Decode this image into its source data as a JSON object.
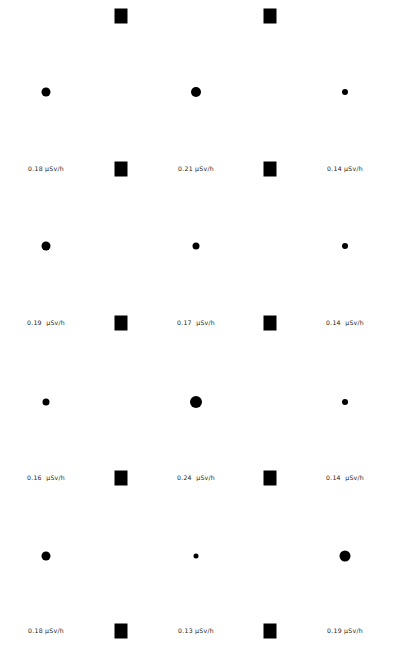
{
  "canvas": {
    "width": 398,
    "height": 646,
    "background": "#ffffff",
    "marker_color": "#000000",
    "label_color": "#1a1a1a"
  },
  "chart_data": {
    "type": "scatter",
    "title": "",
    "subtitle": "",
    "xlabel": "",
    "ylabel": "",
    "unit": "μSv/h",
    "grid": false,
    "legend": "none",
    "xlim": [
      0,
      398
    ],
    "ylim": [
      0,
      646
    ],
    "columns_x": [
      46,
      196,
      345
    ],
    "midpoints_x": [
      121,
      270
    ],
    "series": [
      {
        "name": "circle-markers",
        "marker": "circle",
        "points": [
          {
            "x": 46,
            "y": 92,
            "size": 9
          },
          {
            "x": 196,
            "y": 92,
            "size": 10
          },
          {
            "x": 345,
            "y": 92,
            "size": 6
          },
          {
            "x": 46,
            "y": 246,
            "size": 9
          },
          {
            "x": 196,
            "y": 246,
            "size": 7
          },
          {
            "x": 345,
            "y": 246,
            "size": 6
          },
          {
            "x": 46,
            "y": 402,
            "size": 7
          },
          {
            "x": 196,
            "y": 402,
            "size": 12
          },
          {
            "x": 345,
            "y": 402,
            "size": 6
          },
          {
            "x": 46,
            "y": 556,
            "size": 9
          },
          {
            "x": 196,
            "y": 556,
            "size": 5
          },
          {
            "x": 345,
            "y": 556,
            "size": 11
          }
        ]
      },
      {
        "name": "square-markers",
        "marker": "square",
        "points": [
          {
            "x": 121,
            "y": 16,
            "w": 13,
            "h": 15
          },
          {
            "x": 270,
            "y": 16,
            "w": 13,
            "h": 15
          },
          {
            "x": 121,
            "y": 169,
            "w": 13,
            "h": 15
          },
          {
            "x": 270,
            "y": 169,
            "w": 13,
            "h": 15
          },
          {
            "x": 121,
            "y": 323,
            "w": 13,
            "h": 15
          },
          {
            "x": 270,
            "y": 323,
            "w": 13,
            "h": 15
          },
          {
            "x": 121,
            "y": 478,
            "w": 13,
            "h": 15
          },
          {
            "x": 270,
            "y": 478,
            "w": 13,
            "h": 15
          },
          {
            "x": 121,
            "y": 631,
            "w": 13,
            "h": 15
          },
          {
            "x": 270,
            "y": 631,
            "w": 13,
            "h": 15
          }
        ]
      }
    ],
    "labels": [
      {
        "x": 46,
        "y": 169,
        "value": 0.18,
        "text": "0.18 μSv/h"
      },
      {
        "x": 196,
        "y": 169,
        "value": 0.21,
        "text": "0.21 μSv/h"
      },
      {
        "x": 345,
        "y": 169,
        "value": 0.14,
        "text": "0.14 μSv/h"
      },
      {
        "x": 46,
        "y": 323,
        "value": 0.19,
        "text": "0.19  μSv/h"
      },
      {
        "x": 196,
        "y": 323,
        "value": 0.17,
        "text": "0.17  μSv/h"
      },
      {
        "x": 345,
        "y": 323,
        "value": 0.14,
        "text": "0.14  μSv/h"
      },
      {
        "x": 46,
        "y": 478,
        "value": 0.16,
        "text": "0.16  μSv/h"
      },
      {
        "x": 196,
        "y": 478,
        "value": 0.24,
        "text": "0.24  μSv/h"
      },
      {
        "x": 345,
        "y": 478,
        "value": 0.14,
        "text": "0.14  μSv/h"
      },
      {
        "x": 46,
        "y": 631,
        "value": 0.18,
        "text": "0.18 μSv/h"
      },
      {
        "x": 196,
        "y": 631,
        "value": 0.13,
        "text": "0.13 μSv/h"
      },
      {
        "x": 345,
        "y": 631,
        "value": 0.19,
        "text": "0.19 μSv/h"
      }
    ]
  }
}
